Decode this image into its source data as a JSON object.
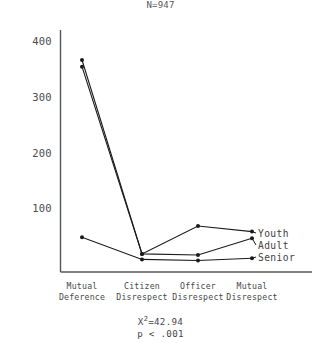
{
  "chart_data": {
    "type": "line",
    "title": "N=947",
    "xlabel": "",
    "ylabel": "",
    "ylim": [
      0,
      430
    ],
    "yticks": [
      100,
      200,
      300,
      400
    ],
    "grid": false,
    "legend_position": "right",
    "categories": [
      "Mutual Deference",
      "Citizen Disrespect",
      "Officer Disrespect",
      "Mutual Disrespect"
    ],
    "category_lines": [
      [
        "Mutual",
        "Deference"
      ],
      [
        "Citizen",
        "Disrespect"
      ],
      [
        "Officer",
        "Disrespect"
      ],
      [
        "Mutual",
        "Disrespect"
      ]
    ],
    "series": [
      {
        "name": "Youth",
        "values": [
          368,
          20,
          70,
          60
        ]
      },
      {
        "name": "Adult",
        "values": [
          356,
          20,
          18,
          48
        ]
      },
      {
        "name": "Senior",
        "values": [
          50,
          10,
          8,
          12
        ]
      }
    ],
    "annotations": {
      "chi_square_symbol": "X",
      "chi_square_exponent": "2",
      "chi_square_value": "=42.94",
      "p_value": "p < .001"
    }
  },
  "legend": {
    "items": [
      {
        "label": "Youth"
      },
      {
        "label": "Adult"
      },
      {
        "label": "Senior"
      }
    ]
  },
  "colors": {
    "line": "#1b1b1b",
    "axis": "#55565a",
    "text": "#46474a",
    "background": "#ffffff"
  }
}
